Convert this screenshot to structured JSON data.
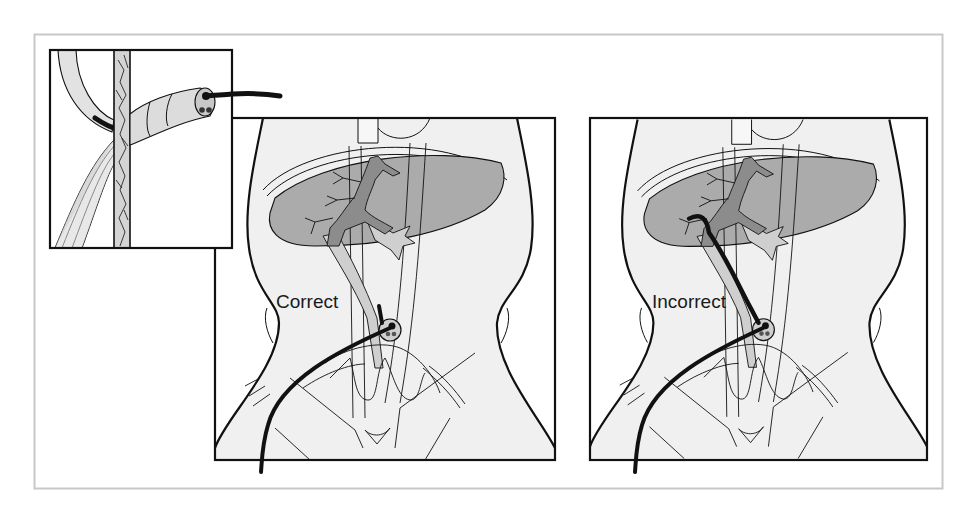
{
  "figure": {
    "panels": [
      {
        "id": "inset",
        "label": "",
        "subject": "catheter through abdominal wall"
      },
      {
        "id": "correct",
        "label": "Correct"
      },
      {
        "id": "incorrect",
        "label": "Incorrect"
      }
    ]
  },
  "colors": {
    "frame": "#c8c8c8",
    "outline": "#111111",
    "body_fill": "#f0f0f0",
    "liver_fill": "#ababab",
    "vessel_dark": "#8c8c8c",
    "vessel_light": "#cfcfcf",
    "catheter": "#111111"
  }
}
